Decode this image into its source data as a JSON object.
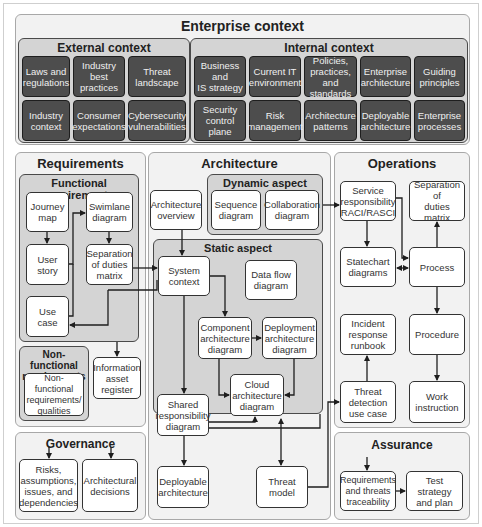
{
  "enterprise_context": {
    "title": "Enterprise context",
    "external": {
      "title": "External context",
      "items": [
        "Laws and\nregulations",
        "Industry\nbest\npractices",
        "Threat\nlandscape",
        "Industry\ncontext",
        "Consumer\nexpectations",
        "Cybersecurity\nvulnerabilities"
      ]
    },
    "internal": {
      "title": "Internal context",
      "items": [
        "Business and\nIS strategy",
        "Current IT\nenvironment",
        "Policies,\npractices, and\nstandards",
        "Enterprise\narchitecture",
        "Guiding\nprinciples",
        "Security\ncontrol plane",
        "Risk\nmanagement",
        "Architecture\npatterns",
        "Deployable\narchitecture",
        "Enterprise\nprocesses"
      ]
    }
  },
  "requirements": {
    "title": "Requirements",
    "functional": {
      "title": "Functional requirements",
      "journey_map": "Journey\nmap",
      "swimlane": "Swimlane\ndiagram",
      "user_story": "User story",
      "separation": "Separation\nof duties\nmatrix",
      "use_case": "Use case"
    },
    "nonfunctional": {
      "title": "Non-functional\nrequirements",
      "item": "Non-functional\nrequirements/\nqualities"
    },
    "info_asset": "Information\nasset\nregister"
  },
  "governance": {
    "title": "Governance",
    "raid": "Risks,\nassumptions,\nissues, and\ndependencies",
    "decisions": "Architectural\ndecisions"
  },
  "architecture": {
    "title": "Architecture",
    "overview": "Architecture\noverview",
    "dynamic": {
      "title": "Dynamic aspect",
      "sequence": "Sequence\ndiagram",
      "collaboration": "Collaboration\ndiagram"
    },
    "static": {
      "title": "Static aspect",
      "system_context": "System\ncontext",
      "data_flow": "Data flow\ndiagram",
      "component": "Component\narchitecture\ndiagram",
      "deployment": "Deployment\narchitecture\ndiagram",
      "cloud": "Cloud\narchitecture\ndiagram",
      "shared": "Shared\nresponsibility\ndiagram"
    },
    "deployable": "Deployable\narchitecture",
    "threat_model": "Threat\nmodel"
  },
  "operations": {
    "title": "Operations",
    "raci": "Service\nresponsibility\nRACI/RASCI",
    "separation": "Separation of\nduties matrix",
    "statechart": "Statechart\ndiagrams",
    "process": "Process",
    "incident": "Incident\nresponse\nrunbook",
    "procedure": "Procedure",
    "threat_detection": "Threat\ndetection\nuse case",
    "work_instruction": "Work\ninstruction"
  },
  "assurance": {
    "title": "Assurance",
    "traceability": "Requirements\nand threats\ntraceability",
    "test_strategy": "Test strategy\nand plan"
  },
  "colors": {
    "dark_box": "#4d4d4d",
    "group_fill": "#d4d4d4",
    "panel_fill": "#f2f2f2",
    "line": "#1e1e1e"
  }
}
